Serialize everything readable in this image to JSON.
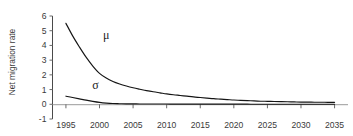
{
  "chart_data": {
    "type": "line",
    "title": "",
    "xlabel": "",
    "ylabel": "Net migration rate",
    "xlim": [
      1993,
      2037
    ],
    "ylim": [
      -1,
      6
    ],
    "grid": false,
    "legend_position": "inline-annotation",
    "x_ticks": [
      "1995",
      "2000",
      "2005",
      "2010",
      "2015",
      "2020",
      "2025",
      "2030",
      "2035"
    ],
    "x_tick_values": [
      1995,
      2000,
      2005,
      2010,
      2015,
      2020,
      2025,
      2030,
      2035
    ],
    "y_ticks": [
      "6",
      "5",
      "4",
      "3",
      "2",
      "1",
      "0",
      "-1"
    ],
    "y_tick_values": [
      6,
      5,
      4,
      3,
      2,
      1,
      0,
      -1
    ],
    "x": [
      1995,
      1996,
      1997,
      1998,
      1999,
      2000,
      2001,
      2002,
      2003,
      2004,
      2005,
      2006,
      2007,
      2008,
      2009,
      2010,
      2011,
      2012,
      2013,
      2014,
      2015,
      2016,
      2017,
      2018,
      2019,
      2020,
      2021,
      2022,
      2023,
      2024,
      2025,
      2026,
      2027,
      2028,
      2029,
      2030,
      2031,
      2032,
      2033,
      2034,
      2035
    ],
    "series": [
      {
        "name": "μ",
        "label": "μ",
        "color": "#151515",
        "annotation_x": 2001,
        "annotation_y": 4.45,
        "values": [
          5.5,
          4.65,
          3.9,
          3.2,
          2.6,
          2.1,
          1.78,
          1.55,
          1.38,
          1.24,
          1.12,
          1.02,
          0.93,
          0.85,
          0.78,
          0.71,
          0.65,
          0.6,
          0.55,
          0.5,
          0.46,
          0.42,
          0.38,
          0.35,
          0.32,
          0.29,
          0.27,
          0.25,
          0.23,
          0.21,
          0.2,
          0.19,
          0.18,
          0.17,
          0.16,
          0.15,
          0.15,
          0.14,
          0.14,
          0.13,
          0.13
        ]
      },
      {
        "name": "σ",
        "label": "σ",
        "color": "#151515",
        "annotation_x": 1999.4,
        "annotation_y": 1.02,
        "values": [
          0.55,
          0.46,
          0.37,
          0.28,
          0.2,
          0.13,
          0.08,
          0.05,
          0.04,
          0.03,
          0.03,
          0.02,
          0.02,
          0.02,
          0.02,
          0.02,
          0.01,
          0.01,
          0.01,
          0.01,
          0.01,
          0.01,
          0.01,
          0.01,
          0.01,
          0.01,
          0.01,
          0.01,
          0.0,
          0.0,
          0.0,
          0.0,
          0.0,
          0.0,
          0.0,
          0.0,
          0.0,
          0.0,
          0.0,
          0.0,
          0.0
        ]
      }
    ]
  },
  "colors": {
    "curve": "#151515",
    "axis": "#4a4a4a",
    "zero_line": "#9a9a9a",
    "tick": "#6b6b6b",
    "text": "#3a3a3a",
    "background": "#ffffff"
  }
}
